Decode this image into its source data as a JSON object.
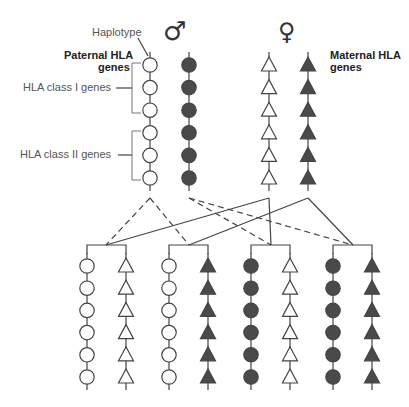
{
  "labels": {
    "haplotype": "Haplotype",
    "paternal_line1": "Paternal HLA",
    "paternal_line2": "genes",
    "maternal_line1": "Maternal HLA",
    "maternal_line2": "genes",
    "class1": "HLA class I genes",
    "class2": "HLA class II genes"
  },
  "symbols": {
    "male": "♂",
    "female": "♀"
  },
  "colors": {
    "filled": "#4a4a4a",
    "outline": "#444444",
    "line": "#444444",
    "label": "#555555"
  },
  "parents": [
    {
      "name": "paternal-haplotype-1",
      "shape": "circle",
      "fill": "white"
    },
    {
      "name": "paternal-haplotype-2",
      "shape": "circle",
      "fill": "dark"
    },
    {
      "name": "maternal-haplotype-1",
      "shape": "triangle",
      "fill": "white"
    },
    {
      "name": "maternal-haplotype-2",
      "shape": "triangle",
      "fill": "dark"
    }
  ],
  "children": [
    {
      "paternal": "white circle",
      "maternal": "white triangle"
    },
    {
      "paternal": "white circle",
      "maternal": "dark triangle"
    },
    {
      "paternal": "dark circle",
      "maternal": "white triangle"
    },
    {
      "paternal": "dark circle",
      "maternal": "dark triangle"
    }
  ],
  "genes_per_haplotype": 6
}
